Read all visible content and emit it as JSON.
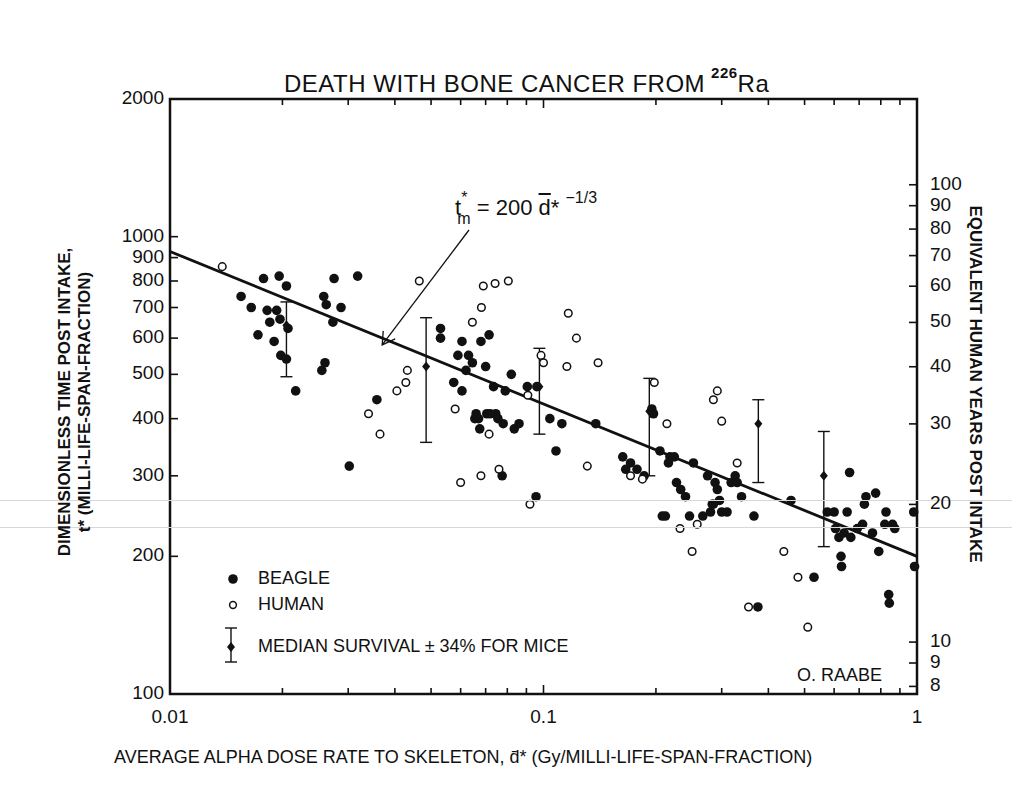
{
  "chart_data": {
    "type": "scatter",
    "title_main": "DEATH WITH BONE CANCER FROM",
    "title_isotope_mass": "226",
    "title_isotope_symbol": "Ra",
    "xlabel": "AVERAGE ALPHA DOSE RATE TO SKELETON, d̄* (Gy/MILLI-LIFE-SPAN-FRACTION)",
    "ylabel": "DIMENSIONLESS TIME POST INTAKE, t* (MILLI-LIFE-SPAN-FRACTION)",
    "ylabel_line1": "DIMENSIONLESS TIME POST INTAKE,",
    "ylabel_line2": "t* (MILLI-LIFE-SPAN-FRACTION)",
    "ylabel_right": "EQUIVALENT HUMAN YEARS POST INTAKE",
    "xscale": "log",
    "yscale": "log",
    "xlim": [
      0.01,
      1
    ],
    "ylim": [
      100,
      2000
    ],
    "x_ticks": [
      {
        "value": 0.01,
        "label": "0.01"
      },
      {
        "value": 0.1,
        "label": "0.1"
      },
      {
        "value": 1,
        "label": "1"
      }
    ],
    "y_ticks_left": [
      {
        "value": 100,
        "label": "100"
      },
      {
        "value": 200,
        "label": "200"
      },
      {
        "value": 300,
        "label": "300"
      },
      {
        "value": 400,
        "label": "400"
      },
      {
        "value": 500,
        "label": "500"
      },
      {
        "value": 600,
        "label": "600"
      },
      {
        "value": 700,
        "label": "700"
      },
      {
        "value": 800,
        "label": "800"
      },
      {
        "value": 900,
        "label": "900"
      },
      {
        "value": 1000,
        "label": "1000"
      },
      {
        "value": 2000,
        "label": "2000"
      }
    ],
    "y_ticks_right": [
      {
        "value": 8,
        "label": "8"
      },
      {
        "value": 9,
        "label": "9"
      },
      {
        "value": 10,
        "label": "10"
      },
      {
        "value": 20,
        "label": "20"
      },
      {
        "value": 30,
        "label": "30"
      },
      {
        "value": 40,
        "label": "40"
      },
      {
        "value": 50,
        "label": "50"
      },
      {
        "value": 60,
        "label": "60"
      },
      {
        "value": 70,
        "label": "70"
      },
      {
        "value": 80,
        "label": "80"
      },
      {
        "value": 90,
        "label": "90"
      },
      {
        "value": 100,
        "label": "100"
      }
    ],
    "right_axis_scale_factor": 0.077,
    "grid": false,
    "legend_position": "lower-left inside",
    "legend": [
      {
        "marker": "filled-circle",
        "label": "BEAGLE"
      },
      {
        "marker": "open-circle",
        "label": "HUMAN"
      },
      {
        "marker": "diamond-errorbar",
        "label": "MEDIAN SURVIVAL ± 34% FOR MICE"
      }
    ],
    "fit_line": {
      "equation": "t*_m = 200 d̄*^(-1/3)",
      "coefficient": 200,
      "exponent": -0.3333,
      "x_range": [
        0.01,
        1
      ]
    },
    "annotations": [
      {
        "text": "t*m = 200 d̄* -1/3",
        "arrow_to": [
          0.037,
          580
        ]
      },
      {
        "text": "O. RAABE",
        "position": "lower-right"
      }
    ],
    "series": [
      {
        "name": "BEAGLE",
        "marker": "filled-circle",
        "points": [
          [
            0.0155,
            740
          ],
          [
            0.0165,
            700
          ],
          [
            0.0178,
            810
          ],
          [
            0.0182,
            690
          ],
          [
            0.0172,
            610
          ],
          [
            0.0185,
            650
          ],
          [
            0.019,
            590
          ],
          [
            0.0193,
            690
          ],
          [
            0.0196,
            820
          ],
          [
            0.0197,
            660
          ],
          [
            0.0198,
            550
          ],
          [
            0.0205,
            780
          ],
          [
            0.0205,
            540
          ],
          [
            0.0207,
            630
          ],
          [
            0.0217,
            460
          ],
          [
            0.0255,
            510
          ],
          [
            0.026,
            530
          ],
          [
            0.0258,
            740
          ],
          [
            0.0262,
            710
          ],
          [
            0.0273,
            650
          ],
          [
            0.0275,
            810
          ],
          [
            0.0287,
            700
          ],
          [
            0.0318,
            820
          ],
          [
            0.0302,
            315
          ],
          [
            0.0358,
            440
          ],
          [
            0.053,
            630
          ],
          [
            0.053,
            600
          ],
          [
            0.0575,
            480
          ],
          [
            0.059,
            550
          ],
          [
            0.0605,
            590
          ],
          [
            0.0605,
            460
          ],
          [
            0.062,
            510
          ],
          [
            0.063,
            550
          ],
          [
            0.0645,
            530
          ],
          [
            0.0655,
            400
          ],
          [
            0.066,
            410
          ],
          [
            0.067,
            400
          ],
          [
            0.0675,
            380
          ],
          [
            0.068,
            590
          ],
          [
            0.07,
            520
          ],
          [
            0.0705,
            410
          ],
          [
            0.0715,
            610
          ],
          [
            0.072,
            410
          ],
          [
            0.0735,
            470
          ],
          [
            0.0745,
            410
          ],
          [
            0.0755,
            400
          ],
          [
            0.0775,
            300
          ],
          [
            0.078,
            390
          ],
          [
            0.079,
            460
          ],
          [
            0.082,
            500
          ],
          [
            0.0835,
            380
          ],
          [
            0.086,
            390
          ],
          [
            0.0905,
            470
          ],
          [
            0.0955,
            270
          ],
          [
            0.096,
            470
          ],
          [
            0.104,
            400
          ],
          [
            0.108,
            340
          ],
          [
            0.112,
            390
          ],
          [
            0.138,
            390
          ],
          [
            0.163,
            330
          ],
          [
            0.166,
            310
          ],
          [
            0.171,
            320
          ],
          [
            0.178,
            310
          ],
          [
            0.195,
            420
          ],
          [
            0.197,
            410
          ],
          [
            0.186,
            300
          ],
          [
            0.205,
            340
          ],
          [
            0.208,
            245
          ],
          [
            0.212,
            245
          ],
          [
            0.216,
            320
          ],
          [
            0.218,
            330
          ],
          [
            0.224,
            330
          ],
          [
            0.227,
            290
          ],
          [
            0.233,
            280
          ],
          [
            0.24,
            270
          ],
          [
            0.246,
            245
          ],
          [
            0.252,
            320
          ],
          [
            0.267,
            245
          ],
          [
            0.275,
            300
          ],
          [
            0.28,
            250
          ],
          [
            0.283,
            260
          ],
          [
            0.285,
            260
          ],
          [
            0.288,
            290
          ],
          [
            0.292,
            280
          ],
          [
            0.296,
            265
          ],
          [
            0.3,
            250
          ],
          [
            0.31,
            250
          ],
          [
            0.318,
            290
          ],
          [
            0.326,
            300
          ],
          [
            0.33,
            290
          ],
          [
            0.339,
            270
          ],
          [
            0.366,
            245
          ],
          [
            0.375,
            155
          ],
          [
            0.46,
            265
          ],
          [
            0.53,
            180
          ],
          [
            0.575,
            250
          ],
          [
            0.6,
            250
          ],
          [
            0.605,
            230
          ],
          [
            0.618,
            220
          ],
          [
            0.626,
            200
          ],
          [
            0.628,
            190
          ],
          [
            0.638,
            225
          ],
          [
            0.65,
            250
          ],
          [
            0.66,
            305
          ],
          [
            0.665,
            220
          ],
          [
            0.692,
            230
          ],
          [
            0.715,
            235
          ],
          [
            0.723,
            260
          ],
          [
            0.73,
            270
          ],
          [
            0.76,
            225
          ],
          [
            0.775,
            275
          ],
          [
            0.79,
            205
          ],
          [
            0.82,
            235
          ],
          [
            0.826,
            250
          ],
          [
            0.84,
            165
          ],
          [
            0.843,
            158
          ],
          [
            0.86,
            235
          ],
          [
            0.872,
            230
          ],
          [
            0.98,
            250
          ],
          [
            0.985,
            190
          ]
        ]
      },
      {
        "name": "HUMAN",
        "marker": "open-circle",
        "points": [
          [
            0.0138,
            860
          ],
          [
            0.034,
            410
          ],
          [
            0.0365,
            370
          ],
          [
            0.0405,
            460
          ],
          [
            0.0428,
            480
          ],
          [
            0.0432,
            510
          ],
          [
            0.0465,
            800
          ],
          [
            0.058,
            420
          ],
          [
            0.06,
            290
          ],
          [
            0.0645,
            650
          ],
          [
            0.068,
            300
          ],
          [
            0.0682,
            700
          ],
          [
            0.069,
            780
          ],
          [
            0.0715,
            370
          ],
          [
            0.0742,
            790
          ],
          [
            0.076,
            310
          ],
          [
            0.0805,
            800
          ],
          [
            0.0908,
            450
          ],
          [
            0.092,
            260
          ],
          [
            0.0985,
            550
          ],
          [
            0.1,
            530
          ],
          [
            0.1165,
            680
          ],
          [
            0.1225,
            600
          ],
          [
            0.1155,
            520
          ],
          [
            0.131,
            315
          ],
          [
            0.14,
            530
          ],
          [
            0.171,
            300
          ],
          [
            0.184,
            295
          ],
          [
            0.198,
            480
          ],
          [
            0.214,
            390
          ],
          [
            0.232,
            230
          ],
          [
            0.25,
            205
          ],
          [
            0.258,
            235
          ],
          [
            0.285,
            440
          ],
          [
            0.292,
            460
          ],
          [
            0.3,
            395
          ],
          [
            0.33,
            320
          ],
          [
            0.354,
            155
          ],
          [
            0.44,
            205
          ],
          [
            0.48,
            180
          ],
          [
            0.51,
            140
          ]
        ]
      },
      {
        "name": "MEDIAN SURVIVAL ± 34% FOR MICE",
        "marker": "diamond-errorbar",
        "points": [
          {
            "x": 0.0205,
            "y": 640,
            "low": 494,
            "high": 720
          },
          {
            "x": 0.0485,
            "y": 520,
            "low": 355,
            "high": 665
          },
          {
            "x": 0.0975,
            "y": 470,
            "low": 370,
            "high": 570
          },
          {
            "x": 0.192,
            "y": 415,
            "low": 300,
            "high": 490
          },
          {
            "x": 0.376,
            "y": 390,
            "low": 290,
            "high": 440
          },
          {
            "x": 0.563,
            "y": 300,
            "low": 210,
            "high": 375
          }
        ]
      }
    ]
  },
  "labels": {
    "author": "O. RAABE",
    "equation_lhs": "t",
    "equation_star": "*",
    "equation_sub": "m",
    "equation_mid": " = 200 ",
    "equation_d": "d",
    "equation_star2": "*",
    "equation_exp": "−1/3"
  }
}
